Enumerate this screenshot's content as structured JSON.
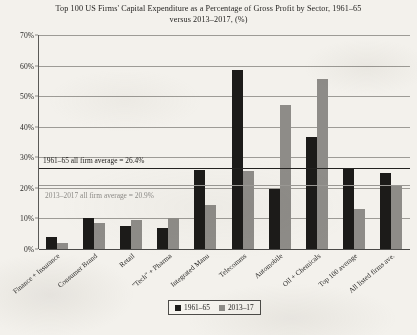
{
  "chart_data": {
    "type": "bar",
    "title": "Top 100 US Firms' Capital Expenditure as a Percentage of Gross Profit by Sector, 1961–65 versus 2013–2017, (%)",
    "xlabel": "",
    "ylabel": "",
    "ylim": [
      0,
      70
    ],
    "ytick_labels": [
      "0%",
      "10%",
      "20%",
      "30%",
      "40%",
      "50%",
      "60%",
      "70%"
    ],
    "ytick_values": [
      0,
      10,
      20,
      30,
      40,
      50,
      60,
      70
    ],
    "grid": true,
    "legend_position": "bottom-center",
    "categories": [
      "Finance + Insurance",
      "Consumer Brand",
      "Retail",
      "\"Tech\" + Pharma",
      "Integrated Manu",
      "Telecomms",
      "Automobile",
      "Oil + Chemicals",
      "Top 100 average",
      "All listed firms ave."
    ],
    "series": [
      {
        "name": "1961–65",
        "color": "#1c1b19",
        "values": [
          4.0,
          10.0,
          7.5,
          7.0,
          26.0,
          58.7,
          19.5,
          36.5,
          26.4,
          24.8
        ]
      },
      {
        "name": "2013–17",
        "color": "#8e8c88",
        "values": [
          2.0,
          8.5,
          9.5,
          10.0,
          14.5,
          25.5,
          47.0,
          55.5,
          13.0,
          20.9
        ]
      }
    ],
    "reference_lines": [
      {
        "label": "1961–65 all firm average = 26.4%",
        "value": 26.4,
        "color": "#232220",
        "style": "solid"
      },
      {
        "label": "2013–2017 all firm average = 20.9%",
        "value": 20.9,
        "color": "#9a9894",
        "style": "solid"
      }
    ]
  }
}
